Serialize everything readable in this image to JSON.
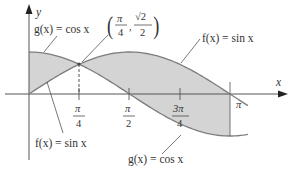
{
  "diagram": {
    "axes": {
      "x_label": "x",
      "y_label": "y"
    },
    "x_ticks": [
      {
        "num": "π",
        "den": "4",
        "value": 0.7854
      },
      {
        "num": "π",
        "den": "2",
        "value": 1.5708
      },
      {
        "num": "3π",
        "den": "4",
        "value": 2.3562
      },
      {
        "num": "π",
        "den": "",
        "value": 3.1416
      }
    ],
    "curves": [
      {
        "name": "f",
        "label_top": "f(x) = sin x",
        "label_bottom": "f(x) = sin x"
      },
      {
        "name": "g",
        "label_top": "g(x) = cos x",
        "label_bottom": "g(x) = cos x"
      }
    ],
    "intersection": {
      "label_x_num": "π",
      "label_x_den": "4",
      "label_y_num": "√2",
      "label_y_den": "2",
      "x": 0.7854,
      "y": 0.7071
    },
    "colors": {
      "fill": "#d3d3d3",
      "curve": "#808080",
      "axis": "#555555",
      "text": "#333333"
    }
  },
  "chart_data": {
    "type": "line",
    "title": "",
    "xlabel": "x",
    "ylabel": "y",
    "xlim": [
      0,
      3.1416
    ],
    "ylim": [
      -1,
      1
    ],
    "x_tick_labels": [
      "π/4",
      "π/2",
      "3π/4",
      "π"
    ],
    "series": [
      {
        "name": "f(x) = sin x",
        "x": [
          0,
          0.7854,
          1.5708,
          2.3562,
          3.1416
        ],
        "values": [
          0,
          0.7071,
          1,
          0.7071,
          0
        ]
      },
      {
        "name": "g(x) = cos x",
        "x": [
          0,
          0.7854,
          1.5708,
          2.3562,
          3.1416
        ],
        "values": [
          1,
          0.7071,
          0,
          -0.7071,
          -1
        ]
      }
    ],
    "annotations": [
      "(π/4, √2/2) intersection point",
      "shaded region between curves from 0 to π"
    ]
  }
}
